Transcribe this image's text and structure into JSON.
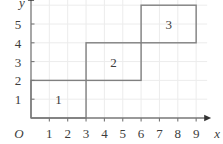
{
  "figure": {
    "title": "",
    "background_color": "#ffffff",
    "grid_color": "#ececec",
    "axis_color": "#777777",
    "shape_stroke_color": "#808080",
    "text_color": "#3c3c3c"
  },
  "axes": {
    "x": {
      "name": "x",
      "ticks": [
        "1",
        "2",
        "3",
        "4",
        "5",
        "6",
        "7",
        "8",
        "9"
      ],
      "tick_values": [
        1,
        2,
        3,
        4,
        5,
        6,
        7,
        8,
        9
      ],
      "range": [
        0,
        9.6
      ],
      "arrow": "right-arrow-icon"
    },
    "y": {
      "name": "y",
      "ticks": [
        "1",
        "2",
        "3",
        "4",
        "5"
      ],
      "tick_values": [
        1,
        2,
        3,
        4,
        5
      ],
      "range": [
        0,
        6.4
      ],
      "arrow": "up-arrow-icon"
    },
    "origin_label": "O"
  },
  "chart_data": {
    "type": "diagram",
    "title": "",
    "xlabel": "x",
    "ylabel": "y",
    "xlim": [
      0,
      9.6
    ],
    "ylim": [
      0,
      6.4
    ],
    "grid": true,
    "legend": "none",
    "x_ticks": [
      1,
      2,
      3,
      4,
      5,
      6,
      7,
      8,
      9
    ],
    "y_ticks": [
      1,
      2,
      3,
      4,
      5
    ],
    "rectangles": [
      {
        "label": "1",
        "x0": 0,
        "y0": 0,
        "x1": 3,
        "y1": 2,
        "width": 3,
        "height": 2,
        "area": 6,
        "label_x": 1.5,
        "label_y": 1
      },
      {
        "label": "2",
        "x0": 3,
        "y0": 2,
        "x1": 6,
        "y1": 4,
        "width": 3,
        "height": 2,
        "area": 6,
        "label_x": 4.5,
        "label_y": 3
      },
      {
        "label": "3",
        "x0": 6,
        "y0": 4,
        "x1": 9,
        "y1": 6,
        "width": 3,
        "height": 2,
        "area": 6,
        "label_x": 7.5,
        "label_y": 5
      }
    ]
  }
}
